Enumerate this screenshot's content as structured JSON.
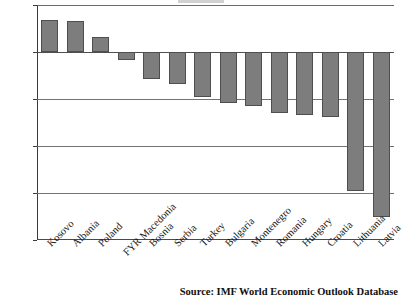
{
  "chart_data": {
    "type": "bar",
    "title": "",
    "xlabel": "",
    "ylabel": "",
    "ylim": [
      -20.0,
      5.0
    ],
    "yticks": [
      "5.0",
      "0.0",
      "-5.0",
      "-10.0",
      "-15.0",
      "-20.0"
    ],
    "ytick_values": [
      5.0,
      0.0,
      -5.0,
      -10.0,
      -15.0,
      -20.0
    ],
    "grid": true,
    "legend": "none",
    "bar_color": "#7d7d7d",
    "bar_border_color": "#4e4e4e",
    "categories": [
      "Kosovo",
      "Albania",
      "Poland",
      "FYR Macedonia",
      "Bosnia",
      "Serbia",
      "Turkey",
      "Bulgaria",
      "Montenegro",
      "Romania",
      "Hungary",
      "Croatia",
      "Lithuania",
      "Latvia"
    ],
    "values": [
      3.4,
      3.3,
      1.6,
      -0.8,
      -2.9,
      -3.4,
      -4.8,
      -5.4,
      -5.7,
      -6.5,
      -6.7,
      -6.9,
      -14.8,
      -17.6
    ]
  },
  "source": {
    "text": "Source: IMF World Economic Outlook Database"
  }
}
